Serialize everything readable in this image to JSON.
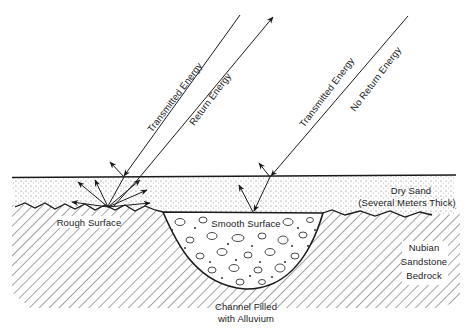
{
  "diagram": {
    "type": "cross-section",
    "colors": {
      "ink": "#1a1a1a",
      "hatch": "#555555",
      "background": "#ffffff"
    },
    "beams": {
      "left": {
        "transmitted_label": "Transmitted Energy",
        "return_label": "Return Energy"
      },
      "right": {
        "transmitted_label": "Transmitted Energy",
        "return_label": "No Return Energy"
      }
    },
    "layers": {
      "sand": {
        "label_line1": "Dry Sand",
        "label_line2": "(Several Meters Thick)"
      },
      "bedrock": {
        "label_line1": "Nubian",
        "label_line2": "Sandstone",
        "label_line3": "Bedrock"
      },
      "channel": {
        "label_line1": "Channel Filled",
        "label_line2": "with Alluvium"
      }
    },
    "surfaces": {
      "rough": "Rough Surface",
      "smooth": "Smooth Surface"
    }
  }
}
